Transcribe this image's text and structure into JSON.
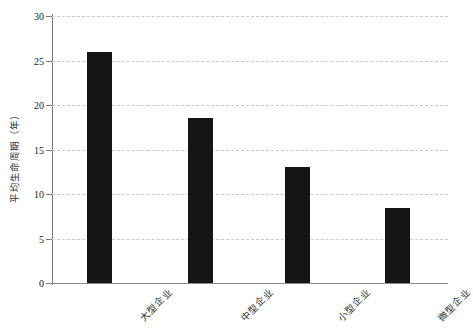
{
  "chart_data": {
    "type": "bar",
    "title": "",
    "subtitle": "",
    "xlabel": "",
    "ylabel": "平均生命周期（年）",
    "categories": [
      "大型企业",
      "中型企业",
      "小型企业",
      "微型企业"
    ],
    "values": [
      26.0,
      18.5,
      13.0,
      8.4
    ],
    "series": [
      {
        "name": "平均生命周期",
        "values": [
          26.0,
          18.5,
          13.0,
          8.4
        ]
      }
    ],
    "ylim": [
      0,
      30
    ],
    "y_ticks": [
      0,
      5,
      10,
      15,
      20,
      25,
      30
    ],
    "y_tick_labels": [
      "0",
      "5",
      "10",
      "15",
      "20",
      "25",
      "30"
    ],
    "grid": true,
    "grid_axis": "y",
    "grid_style": "dashed",
    "legend": false,
    "legend_position": "none",
    "bar_color": "#151515",
    "grid_color": "#c9c9c9",
    "axis_color": "#7a7a7a",
    "annotations": []
  }
}
